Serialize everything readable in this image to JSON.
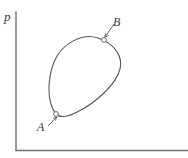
{
  "figure": {
    "type": "line-diagram",
    "background_color": "#ffffff",
    "axes": {
      "y_axis_label": "p",
      "x_axis_label": "",
      "axis_color": "#6f6f6f",
      "axis_line_width": 1.4,
      "origin_x": 16,
      "origin_y": 150,
      "y_axis_top": 12,
      "x_axis_right": 188
    },
    "curve": {
      "name": "cycle-loop",
      "closed": true,
      "stroke_color": "#59595c",
      "stroke_width": 1.1,
      "fill": "none",
      "path": "M 56 114 C 47 103 47 80 54 62 C 62 42 84 33 98 38 C 116 44 123 58 120 69 C 116 85 95 103 79 111 C 70 116 61 119 56 114 Z"
    },
    "markers": [
      {
        "id": "A",
        "label": "A",
        "cx": 56,
        "cy": 114,
        "r": 2.4,
        "stroke_color": "#59595c",
        "fill": "#ffffff",
        "leader": {
          "from_x": 48,
          "from_y": 126,
          "to_x": 57,
          "to_y": 117,
          "arrow_at": "end"
        }
      },
      {
        "id": "B",
        "label": "B",
        "cx": 104,
        "cy": 40,
        "r": 2.4,
        "stroke_color": "#59595c",
        "fill": "#ffffff",
        "leader": {
          "from_x": 114,
          "from_y": 24,
          "to_x": 105,
          "to_y": 37,
          "arrow_at": "end"
        }
      }
    ],
    "label_color": "#3a3a3a"
  }
}
